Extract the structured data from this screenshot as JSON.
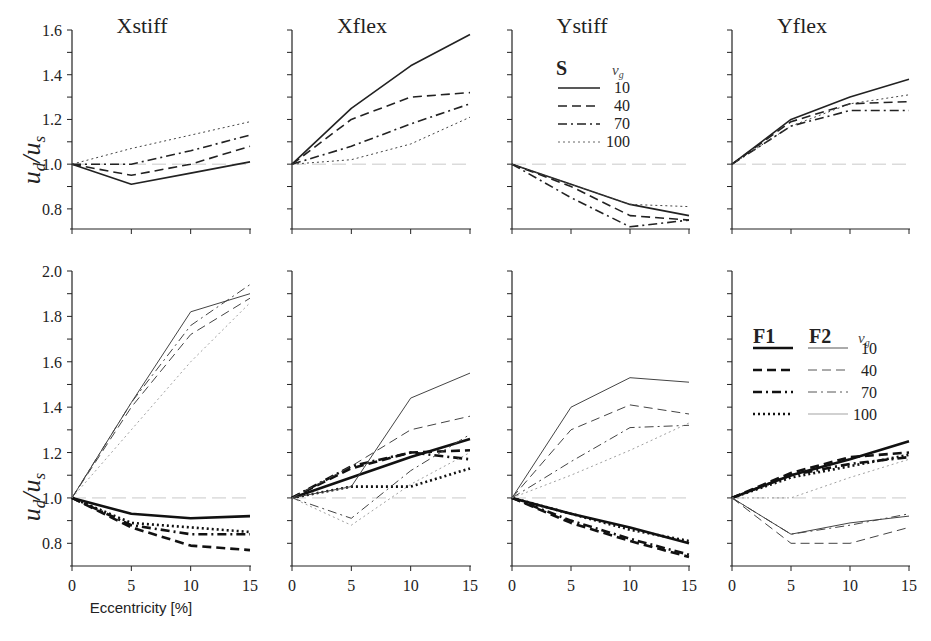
{
  "chart_data": {
    "type": "line",
    "xlabel": "Eccentricity [%]",
    "ylabel": "u_d/u_s",
    "x": [
      0,
      5,
      10,
      15
    ],
    "x_ticks": [
      "0",
      "5",
      "10",
      "15"
    ],
    "rows": [
      {
        "ylim": [
          0.7,
          1.6
        ],
        "y_ticks": [
          "0.8",
          "1.0",
          "1.2",
          "1.4",
          "1.6"
        ],
        "legend": {
          "panel": 2,
          "heads": [
            "S"
          ],
          "vg_label": "v_g",
          "entries": [
            "10",
            "40",
            "70",
            "100"
          ]
        },
        "panels": [
          {
            "title": "Xstiff",
            "series": [
              {
                "name": "S vg=10",
                "style": "solid",
                "weight": "medium",
                "values": [
                  1.0,
                  0.91,
                  0.96,
                  1.01
                ]
              },
              {
                "name": "S vg=40",
                "style": "dash",
                "weight": "medium",
                "values": [
                  1.0,
                  0.95,
                  1.0,
                  1.08
                ]
              },
              {
                "name": "S vg=70",
                "style": "dashdot",
                "weight": "medium",
                "values": [
                  1.0,
                  1.0,
                  1.06,
                  1.13
                ]
              },
              {
                "name": "S vg=100",
                "style": "dot",
                "weight": "thin",
                "values": [
                  1.0,
                  1.07,
                  1.13,
                  1.19
                ]
              }
            ]
          },
          {
            "title": "Xflex",
            "series": [
              {
                "name": "S vg=10",
                "style": "solid",
                "weight": "medium",
                "values": [
                  1.0,
                  1.25,
                  1.44,
                  1.58
                ]
              },
              {
                "name": "S vg=40",
                "style": "dash",
                "weight": "medium",
                "values": [
                  1.0,
                  1.2,
                  1.3,
                  1.32
                ]
              },
              {
                "name": "S vg=70",
                "style": "dashdot",
                "weight": "medium",
                "values": [
                  1.0,
                  1.08,
                  1.18,
                  1.27
                ]
              },
              {
                "name": "S vg=100",
                "style": "dot",
                "weight": "thin",
                "values": [
                  1.0,
                  1.02,
                  1.09,
                  1.21
                ]
              }
            ]
          },
          {
            "title": "Ystiff",
            "series": [
              {
                "name": "S vg=10",
                "style": "solid",
                "weight": "medium",
                "values": [
                  1.0,
                  0.91,
                  0.82,
                  0.77
                ]
              },
              {
                "name": "S vg=40",
                "style": "dash",
                "weight": "medium",
                "values": [
                  1.0,
                  0.9,
                  0.77,
                  0.75
                ]
              },
              {
                "name": "S vg=70",
                "style": "dashdot",
                "weight": "medium",
                "values": [
                  1.0,
                  0.85,
                  0.72,
                  0.75
                ]
              },
              {
                "name": "S vg=100",
                "style": "dot",
                "weight": "thin",
                "values": [
                  1.0,
                  0.91,
                  0.82,
                  0.81
                ]
              }
            ]
          },
          {
            "title": "Yflex",
            "series": [
              {
                "name": "S vg=10",
                "style": "solid",
                "weight": "medium",
                "values": [
                  1.0,
                  1.2,
                  1.3,
                  1.38
                ]
              },
              {
                "name": "S vg=40",
                "style": "dash",
                "weight": "medium",
                "values": [
                  1.0,
                  1.19,
                  1.27,
                  1.28
                ]
              },
              {
                "name": "S vg=70",
                "style": "dashdot",
                "weight": "medium",
                "values": [
                  1.0,
                  1.17,
                  1.24,
                  1.24
                ]
              },
              {
                "name": "S vg=100",
                "style": "dot",
                "weight": "thin",
                "values": [
                  1.0,
                  1.17,
                  1.27,
                  1.31
                ]
              }
            ]
          }
        ]
      },
      {
        "ylim": [
          0.7,
          2.0
        ],
        "y_ticks": [
          "0.8",
          "1.0",
          "1.2",
          "1.4",
          "1.6",
          "1.8",
          "2.0"
        ],
        "legend": {
          "panel": 3,
          "heads": [
            "F1",
            "F2"
          ],
          "vg_label": "v_g",
          "entries": [
            "10",
            "40",
            "70",
            "100"
          ]
        },
        "panels": [
          {
            "title": "",
            "series": [
              {
                "name": "F1 vg=10",
                "style": "solid",
                "weight": "thick",
                "values": [
                  1.0,
                  0.93,
                  0.91,
                  0.92
                ]
              },
              {
                "name": "F1 vg=40",
                "style": "dash",
                "weight": "thick",
                "values": [
                  1.0,
                  0.87,
                  0.79,
                  0.77
                ]
              },
              {
                "name": "F1 vg=70",
                "style": "dashdot",
                "weight": "thick",
                "values": [
                  1.0,
                  0.88,
                  0.84,
                  0.84
                ]
              },
              {
                "name": "F1 vg=100",
                "style": "dot",
                "weight": "thick",
                "values": [
                  1.0,
                  0.89,
                  0.87,
                  0.85
                ]
              },
              {
                "name": "F2 vg=10",
                "style": "solid",
                "weight": "thin",
                "values": [
                  1.0,
                  1.42,
                  1.82,
                  1.9
                ]
              },
              {
                "name": "F2 vg=40",
                "style": "dash",
                "weight": "thin",
                "values": [
                  1.0,
                  1.4,
                  1.72,
                  1.88
                ]
              },
              {
                "name": "F2 vg=70",
                "style": "dashdot",
                "weight": "thin",
                "values": [
                  1.0,
                  1.42,
                  1.76,
                  1.94
                ]
              },
              {
                "name": "F2 vg=100",
                "style": "dot",
                "weight": "hair",
                "values": [
                  1.0,
                  1.3,
                  1.6,
                  1.86
                ]
              }
            ]
          },
          {
            "title": "",
            "series": [
              {
                "name": "F1 vg=10",
                "style": "solid",
                "weight": "thick",
                "values": [
                  1.0,
                  1.09,
                  1.18,
                  1.26
                ]
              },
              {
                "name": "F1 vg=40",
                "style": "dash",
                "weight": "thick",
                "values": [
                  1.0,
                  1.13,
                  1.2,
                  1.21
                ]
              },
              {
                "name": "F1 vg=70",
                "style": "dashdot",
                "weight": "thick",
                "values": [
                  1.0,
                  1.14,
                  1.2,
                  1.17
                ]
              },
              {
                "name": "F1 vg=100",
                "style": "dot",
                "weight": "thick",
                "values": [
                  1.0,
                  1.05,
                  1.05,
                  1.13
                ]
              },
              {
                "name": "F2 vg=10",
                "style": "solid",
                "weight": "thin",
                "values": [
                  1.0,
                  1.05,
                  1.44,
                  1.55
                ]
              },
              {
                "name": "F2 vg=40",
                "style": "dash",
                "weight": "thin",
                "values": [
                  1.0,
                  1.14,
                  1.3,
                  1.36
                ]
              },
              {
                "name": "F2 vg=70",
                "style": "dashdot",
                "weight": "thin",
                "values": [
                  1.0,
                  0.91,
                  1.12,
                  1.28
                ]
              },
              {
                "name": "F2 vg=100",
                "style": "dot",
                "weight": "hair",
                "values": [
                  1.0,
                  0.88,
                  1.06,
                  1.2
                ]
              }
            ]
          },
          {
            "title": "",
            "series": [
              {
                "name": "F1 vg=10",
                "style": "solid",
                "weight": "thick",
                "values": [
                  1.0,
                  0.93,
                  0.87,
                  0.8
                ]
              },
              {
                "name": "F1 vg=40",
                "style": "dash",
                "weight": "thick",
                "values": [
                  1.0,
                  0.89,
                  0.81,
                  0.74
                ]
              },
              {
                "name": "F1 vg=70",
                "style": "dashdot",
                "weight": "thick",
                "values": [
                  1.0,
                  0.9,
                  0.82,
                  0.75
                ]
              },
              {
                "name": "F1 vg=100",
                "style": "dot",
                "weight": "thick",
                "values": [
                  1.0,
                  0.93,
                  0.86,
                  0.81
                ]
              },
              {
                "name": "F2 vg=10",
                "style": "solid",
                "weight": "thin",
                "values": [
                  1.0,
                  1.4,
                  1.53,
                  1.51
                ]
              },
              {
                "name": "F2 vg=40",
                "style": "dash",
                "weight": "thin",
                "values": [
                  1.0,
                  1.3,
                  1.41,
                  1.37
                ]
              },
              {
                "name": "F2 vg=70",
                "style": "dashdot",
                "weight": "thin",
                "values": [
                  1.0,
                  1.16,
                  1.31,
                  1.32
                ]
              },
              {
                "name": "F2 vg=100",
                "style": "dot",
                "weight": "hair",
                "values": [
                  1.0,
                  1.1,
                  1.21,
                  1.33
                ]
              }
            ]
          },
          {
            "title": "",
            "series": [
              {
                "name": "F1 vg=10",
                "style": "solid",
                "weight": "thick",
                "values": [
                  1.0,
                  1.1,
                  1.17,
                  1.25
                ]
              },
              {
                "name": "F1 vg=40",
                "style": "dash",
                "weight": "thick",
                "values": [
                  1.0,
                  1.11,
                  1.18,
                  1.2
                ]
              },
              {
                "name": "F1 vg=70",
                "style": "dashdot",
                "weight": "thick",
                "values": [
                  1.0,
                  1.1,
                  1.15,
                  1.18
                ]
              },
              {
                "name": "F1 vg=100",
                "style": "dot",
                "weight": "thick",
                "values": [
                  1.0,
                  1.09,
                  1.14,
                  1.19
                ]
              },
              {
                "name": "F2 vg=10",
                "style": "solid",
                "weight": "thin",
                "values": [
                  1.0,
                  0.84,
                  0.89,
                  0.92
                ]
              },
              {
                "name": "F2 vg=40",
                "style": "dash",
                "weight": "thin",
                "values": [
                  1.0,
                  0.8,
                  0.8,
                  0.87
                ]
              },
              {
                "name": "F2 vg=70",
                "style": "dashdot",
                "weight": "thin",
                "values": [
                  1.0,
                  0.84,
                  0.88,
                  0.93
                ]
              },
              {
                "name": "F2 vg=100",
                "style": "dot",
                "weight": "hair",
                "values": [
                  1.0,
                  1.0,
                  1.09,
                  1.17
                ]
              }
            ]
          }
        ]
      }
    ],
    "reference_line": 1.0,
    "grid": false,
    "legend_position": "inside panel (top row: Ystiff; bottom row: Yflex)"
  }
}
